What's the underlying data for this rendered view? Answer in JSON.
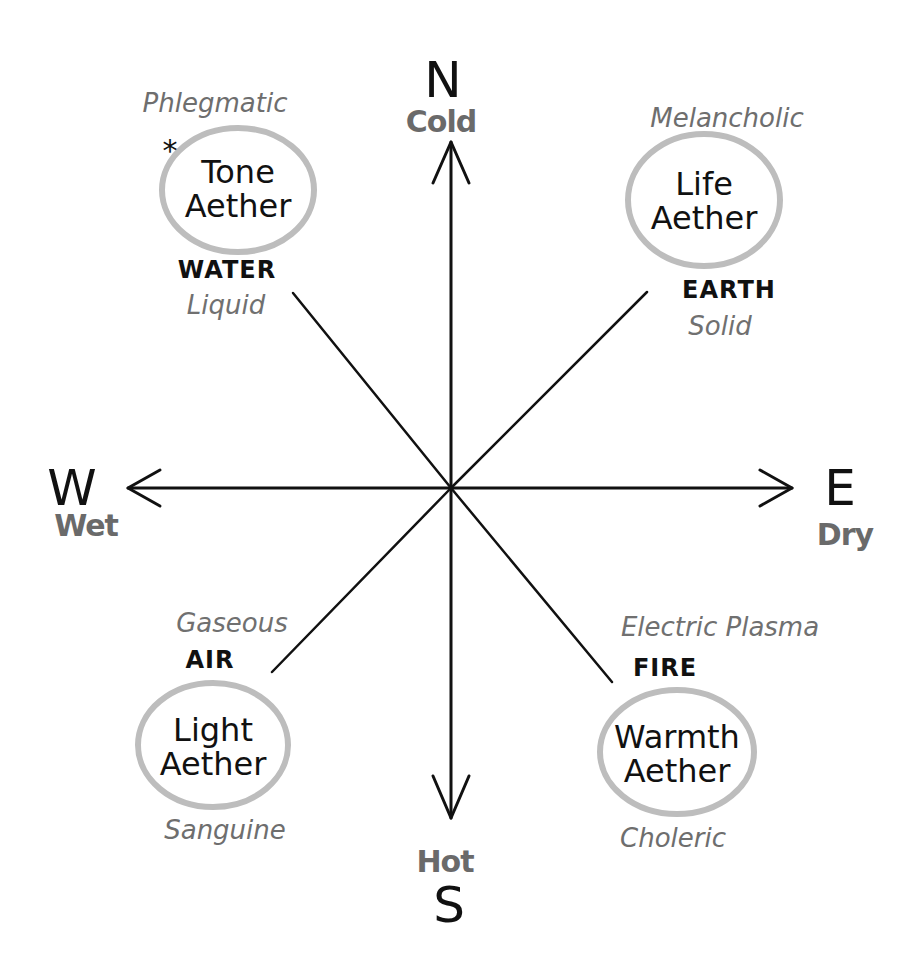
{
  "directions": {
    "north": {
      "letter": "N",
      "quality": "Cold"
    },
    "south": {
      "letter": "S",
      "quality": "Hot"
    },
    "west": {
      "letter": "W",
      "quality": "Wet"
    },
    "east": {
      "letter": "E",
      "quality": "Dry"
    }
  },
  "quadrants": {
    "northwest": {
      "temperament": "Phlegmatic",
      "ether": [
        "Tone",
        "Aether"
      ],
      "marker": "*",
      "element": "WATER",
      "state": "Liquid"
    },
    "northeast": {
      "temperament": "Melancholic",
      "ether": [
        "Life",
        "Aether"
      ],
      "element": "EARTH",
      "state": "Solid"
    },
    "southwest": {
      "state": "Gaseous",
      "element": "AIR",
      "ether": [
        "Light",
        "Aether"
      ],
      "temperament": "Sanguine"
    },
    "southeast": {
      "state": "Electric Plasma",
      "element": "FIRE",
      "ether": [
        "Warmth",
        "Aether"
      ],
      "temperament": "Choleric"
    }
  },
  "colors": {
    "ink": "#111111",
    "pencil_gray": "#6a6a6a",
    "ellipse_gray": "#bdbdbd",
    "background": "#ffffff"
  }
}
